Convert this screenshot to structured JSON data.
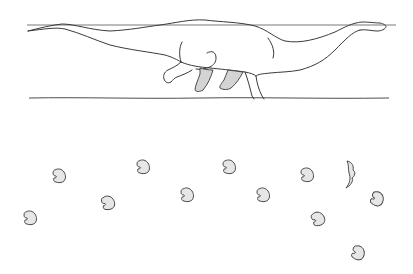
{
  "figure": {
    "subject": "Wading sauropod dinosaur with trackway",
    "colors": {
      "background": "#ffffff",
      "line": "#3a3a3a",
      "water_line": "#6a6a6a",
      "fill": "#e6e6e6",
      "shade": "#d4d4d4"
    },
    "water_surface": {
      "y": 25,
      "x1": 27,
      "x2": 396
    },
    "ground_line": {
      "y": 98,
      "x1": 29,
      "x2": 389
    },
    "footprints": [
      {
        "id": "fp1",
        "x": 59,
        "y": 176,
        "rot": 0
      },
      {
        "id": "fp2",
        "x": 30,
        "y": 218,
        "rot": 0
      },
      {
        "id": "fp3",
        "x": 108,
        "y": 203,
        "rot": -10
      },
      {
        "id": "fp4",
        "x": 143,
        "y": 167,
        "rot": 0
      },
      {
        "id": "fp5",
        "x": 187,
        "y": 195,
        "rot": 0
      },
      {
        "id": "fp6",
        "x": 229,
        "y": 167,
        "rot": 0
      },
      {
        "id": "fp7",
        "x": 263,
        "y": 195,
        "rot": 0
      },
      {
        "id": "fp8",
        "x": 307,
        "y": 175,
        "rot": 0
      },
      {
        "id": "fp10",
        "x": 377,
        "y": 199,
        "rot": 25
      },
      {
        "id": "fp11",
        "x": 318,
        "y": 219,
        "rot": -15
      },
      {
        "id": "fp12",
        "x": 358,
        "y": 253,
        "rot": 20
      }
    ],
    "partial_print": {
      "x": 352,
      "y": 175
    }
  }
}
